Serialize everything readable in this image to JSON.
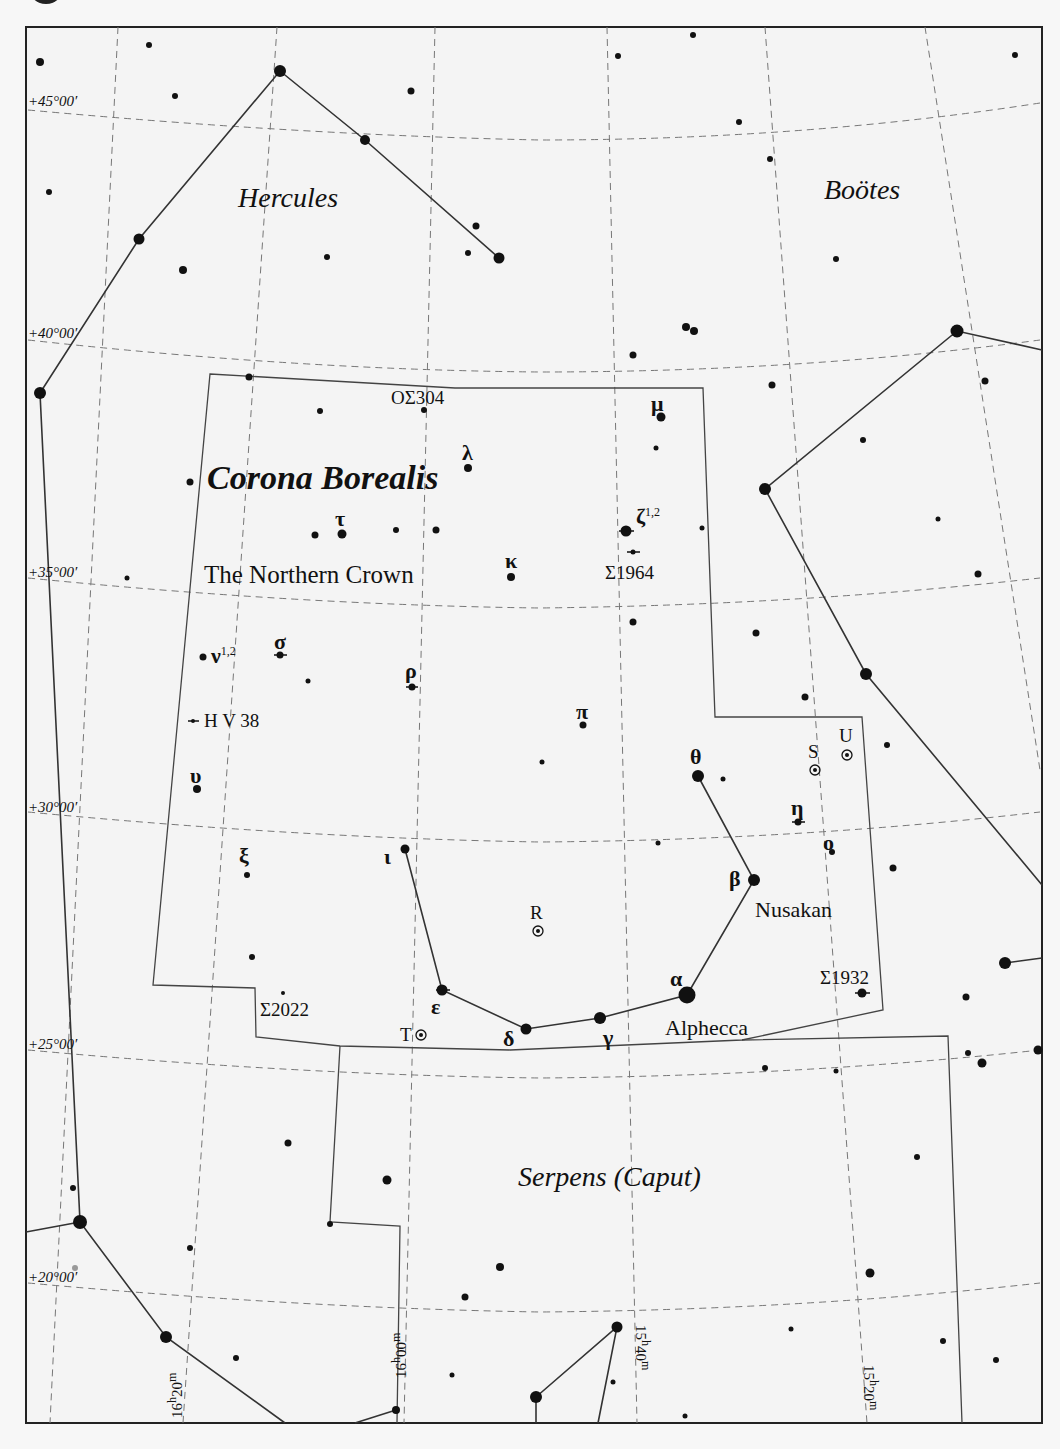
{
  "map": {
    "title": "Corona Borealis",
    "subtitle": "The Northern Crown",
    "neighbor_constellations": [
      "Hercules",
      "Boötes",
      "Serpens (Caput)"
    ],
    "declination_labels": [
      "+45°00′",
      "+40°00′",
      "+35°00′",
      "+30°00′",
      "+25°00′",
      "+20°00′"
    ],
    "ra_labels": [
      "16h20m",
      "16h00m",
      "15h40m",
      "15h20m"
    ],
    "ra_label_parts": [
      {
        "h": "16",
        "m": "20"
      },
      {
        "h": "16",
        "m": "00"
      },
      {
        "h": "15",
        "m": "40"
      },
      {
        "h": "15",
        "m": "20"
      }
    ],
    "star_labels": {
      "alpha": "α",
      "alpha_name": "Alphecca",
      "beta": "β",
      "beta_name": "Nusakan",
      "gamma": "γ",
      "delta": "δ",
      "epsilon": "ε",
      "theta": "θ",
      "iota": "ι",
      "kappa": "κ",
      "lambda": "λ",
      "mu": "μ",
      "nu": "ν",
      "nu_sup": "1,2",
      "xi": "ξ",
      "omicron": "ο",
      "pi": "π",
      "rho": "ρ",
      "sigma": "σ",
      "tau": "τ",
      "upsilon": "υ",
      "zeta": "ζ",
      "zeta_sup": "1,2",
      "eta": "η"
    },
    "variable_stars": [
      "R",
      "S",
      "T",
      "U"
    ],
    "double_stars": [
      "OΣ304",
      "Σ1964",
      "Σ2022",
      "Σ1932",
      "H V 38"
    ],
    "colors": {
      "background": "#f7f7f7",
      "ink": "#111111",
      "grid": "#777777",
      "boundary": "#444444"
    }
  }
}
